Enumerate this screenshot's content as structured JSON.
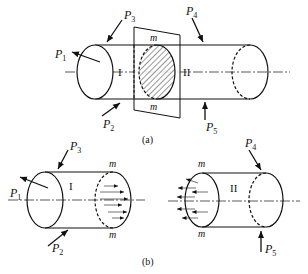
{
  "figure": {
    "part_a": {
      "caption": "(a)",
      "forces": [
        {
          "name": "P",
          "sub": "1"
        },
        {
          "name": "P",
          "sub": "2"
        },
        {
          "name": "P",
          "sub": "3"
        },
        {
          "name": "P",
          "sub": "4"
        },
        {
          "name": "P",
          "sub": "5"
        }
      ],
      "section_labels": {
        "left": "I",
        "right": "II"
      },
      "plane_labels": {
        "top": "m",
        "bottom": "m"
      }
    },
    "part_b": {
      "caption": "(b)",
      "left": {
        "forces": [
          {
            "name": "P",
            "sub": "1"
          },
          {
            "name": "P",
            "sub": "2"
          },
          {
            "name": "P",
            "sub": "3"
          }
        ],
        "section_label": "I",
        "cut_labels": {
          "top": "m",
          "bottom": "m"
        }
      },
      "right": {
        "forces": [
          {
            "name": "P",
            "sub": "4"
          },
          {
            "name": "P",
            "sub": "5"
          }
        ],
        "section_label": "II",
        "cut_labels": {
          "top": "m",
          "bottom": "m"
        }
      }
    }
  }
}
